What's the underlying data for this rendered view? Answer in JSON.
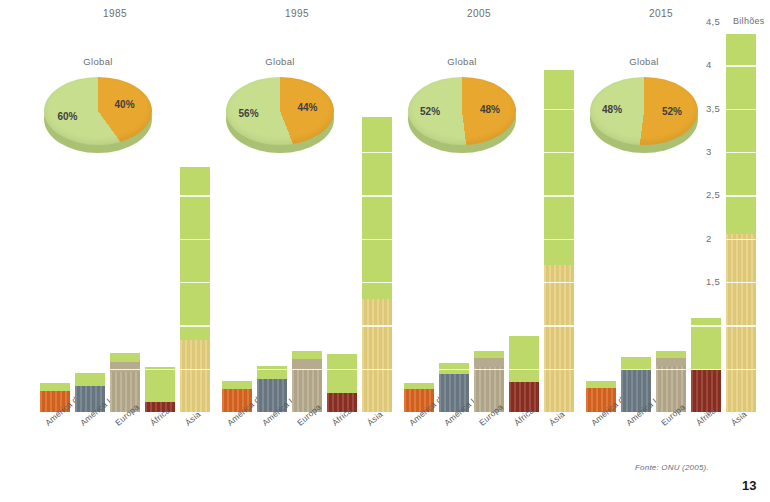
{
  "axis": {
    "unit_label": "Bilhões",
    "ticks": [
      "4,5",
      "4",
      "3,5",
      "3",
      "2,5",
      "2",
      "1,5",
      "1",
      "0,5",
      "0"
    ],
    "min": 0,
    "max": 4.5,
    "step": 0.5
  },
  "footer": {
    "source": "Fonte: ONU (2005).",
    "page": "13"
  },
  "pie_title": "Global",
  "colors": {
    "rural_green": "#bcd96a",
    "urban_orange": "#e8a72e",
    "pie_green": "#c7de8e",
    "pie_green_side": "#aec77a",
    "pie_orange_side": "#cf9428",
    "north_america": "#d9641f",
    "latin_america": "#6b7a86",
    "europe": "#b6ab8e",
    "africa": "#8e2f22",
    "asia": "#e6cf7e"
  },
  "chart_data": {
    "type": "bar",
    "subtitle": "",
    "xlabel": "",
    "ylabel": "Bilhões",
    "ylim": [
      0,
      4.5
    ],
    "ystep": 0.5,
    "grid": true,
    "legend_position": "none",
    "stacked": true,
    "categories": [
      "América do Norte",
      "América Latina",
      "Europa",
      "África",
      "Ásia"
    ],
    "panels": [
      {
        "year": "1985",
        "pie": {
          "label": "Global",
          "slices": [
            {
              "name": "rural",
              "value": 60,
              "display": "60%"
            },
            {
              "name": "urbana",
              "value": 40,
              "display": "40%"
            }
          ]
        },
        "bars": [
          {
            "category": "América do Norte",
            "urban": 0.24,
            "rural": 0.09,
            "total": 0.33
          },
          {
            "category": "América Latina",
            "urban": 0.3,
            "rural": 0.15,
            "total": 0.45
          },
          {
            "category": "Europa",
            "urban": 0.46,
            "rural": 0.22,
            "total": 0.68
          },
          {
            "category": "África",
            "urban": 0.12,
            "rural": 0.4,
            "total": 0.52
          },
          {
            "category": "Ásia",
            "urban": 0.83,
            "rural": 2.0,
            "total": 2.83
          }
        ]
      },
      {
        "year": "1995",
        "pie": {
          "label": "Global",
          "slices": [
            {
              "name": "rural",
              "value": 56,
              "display": "56%"
            },
            {
              "name": "urbana",
              "value": 44,
              "display": "44%"
            }
          ]
        },
        "bars": [
          {
            "category": "América do Norte",
            "urban": 0.27,
            "rural": 0.09,
            "total": 0.36
          },
          {
            "category": "América Latina",
            "urban": 0.38,
            "rural": 0.15,
            "total": 0.53
          },
          {
            "category": "Europa",
            "urban": 0.5,
            "rural": 0.2,
            "total": 0.7
          },
          {
            "category": "África",
            "urban": 0.22,
            "rural": 0.45,
            "total": 0.67
          },
          {
            "category": "Ásia",
            "urban": 1.3,
            "rural": 2.1,
            "total": 3.4
          }
        ]
      },
      {
        "year": "2005",
        "pie": {
          "label": "Global",
          "slices": [
            {
              "name": "rural",
              "value": 52,
              "display": "52%"
            },
            {
              "name": "urbana",
              "value": 48,
              "display": "48%"
            }
          ]
        },
        "bars": [
          {
            "category": "América do Norte",
            "urban": 0.26,
            "rural": 0.08,
            "total": 0.34
          },
          {
            "category": "América Latina",
            "urban": 0.44,
            "rural": 0.13,
            "total": 0.57
          },
          {
            "category": "Europa",
            "urban": 0.52,
            "rural": 0.18,
            "total": 0.7
          },
          {
            "category": "África",
            "urban": 0.35,
            "rural": 0.53,
            "total": 0.88
          },
          {
            "category": "Ásia",
            "urban": 1.7,
            "rural": 2.25,
            "total": 3.95
          }
        ]
      },
      {
        "year": "2015",
        "pie": {
          "label": "Global",
          "slices": [
            {
              "name": "rural",
              "value": 48,
              "display": "48%"
            },
            {
              "name": "urbana",
              "value": 52,
              "display": "52%"
            }
          ]
        },
        "bars": [
          {
            "category": "América do Norte",
            "urban": 0.28,
            "rural": 0.08,
            "total": 0.36
          },
          {
            "category": "América Latina",
            "urban": 0.5,
            "rural": 0.14,
            "total": 0.64
          },
          {
            "category": "Europa",
            "urban": 0.53,
            "rural": 0.17,
            "total": 0.7
          },
          {
            "category": "África",
            "urban": 0.48,
            "rural": 0.6,
            "total": 1.08
          },
          {
            "category": "Ásia",
            "urban": 2.05,
            "rural": 2.31,
            "total": 4.36
          }
        ]
      }
    ]
  }
}
